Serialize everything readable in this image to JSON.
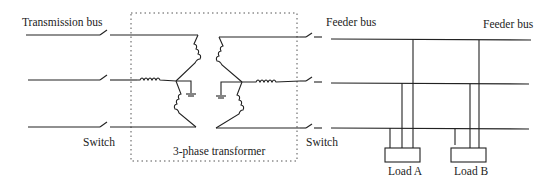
{
  "labels": {
    "transmission_bus": "Transmission bus",
    "switch_left": "Switch",
    "transformer": "3-phase transformer",
    "switch_right": "Switch",
    "feeder_bus_left": "Feeder bus",
    "feeder_bus_right": "Feeder bus",
    "load_a": "Load A",
    "load_b": "Load B"
  },
  "colors": {
    "line": "#222222",
    "background": "#ffffff",
    "dotted_box": "#555555"
  }
}
